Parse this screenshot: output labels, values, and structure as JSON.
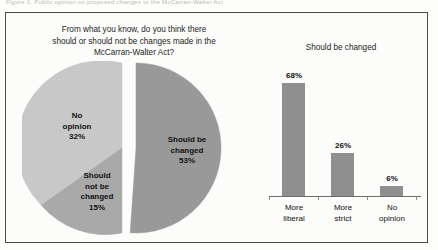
{
  "figure": {
    "caption": "Figure 1.  Public opinion on proposed changes to the McCarran-Walter Act",
    "frame_color": "#4a4a48",
    "background": "#fcfcfa"
  },
  "pie_panel": {
    "title_line1": "From what you know, do you think there",
    "title_line2": "should or should not be changes made in the",
    "title_line3": "McCarran-Walter Act?",
    "labels": {
      "no_opinion": {
        "line1": "No",
        "line2": "opinion",
        "value": "32%"
      },
      "should_not_be_changed": {
        "line1": "Should",
        "line2": "not be",
        "line3": "changed",
        "value": "15%"
      },
      "should_be_changed": {
        "line1": "Should be",
        "line2": "changed",
        "value": "53%"
      }
    }
  },
  "bar_panel": {
    "title": "Should be changed"
  },
  "chart_data": [
    {
      "type": "pie",
      "title": "From what you know, do you think there should or should not be changes made in the McCarran-Walter Act?",
      "exploded_slice": "Should be changed",
      "legend": "none",
      "labels": [
        "Should be changed",
        "No opinion",
        "Should not be changed"
      ],
      "values": [
        53,
        32,
        15
      ],
      "value_labels": [
        "53%",
        "32%",
        "15%"
      ],
      "unit": "percent",
      "colors": [
        "#999999",
        "#c8c8c8",
        "#a9a9a9"
      ]
    },
    {
      "type": "bar",
      "title": "Should be changed",
      "categories": [
        "More liberal",
        "More strict",
        "No opinion"
      ],
      "category_lines": [
        [
          "More",
          "liberal"
        ],
        [
          "More",
          "strict"
        ],
        [
          "No",
          "opinion"
        ]
      ],
      "values": [
        68,
        26,
        6
      ],
      "value_labels": [
        "68%",
        "26%",
        "6%"
      ],
      "xlabel": "",
      "ylabel": "",
      "ylim": [
        0,
        75
      ],
      "grid": false,
      "unit": "percent",
      "bar_color": "#8f8f8f",
      "axis_color": "#6d6d6b"
    }
  ]
}
